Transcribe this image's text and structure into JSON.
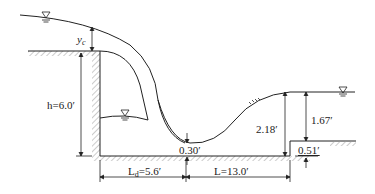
{
  "diagram": {
    "type": "hydraulic jump / drop structure cross-section",
    "labels": {
      "critical_depth": "y",
      "critical_depth_sub": "c",
      "drop_height": "h=6.0′",
      "drop_length_main": "L",
      "drop_length_sub": "d",
      "drop_length_value": "=5.6′",
      "jump_length": "L=13.0′",
      "min_depth": "0.30′",
      "jump_depth": "2.18′",
      "tailwater_depth": "1.67′",
      "sill_height": "0.51′"
    },
    "symbols": {
      "water_surface_marker": "∇"
    },
    "colors": {
      "line": "#222222",
      "hatch": "#888888",
      "background": "#ffffff"
    }
  }
}
